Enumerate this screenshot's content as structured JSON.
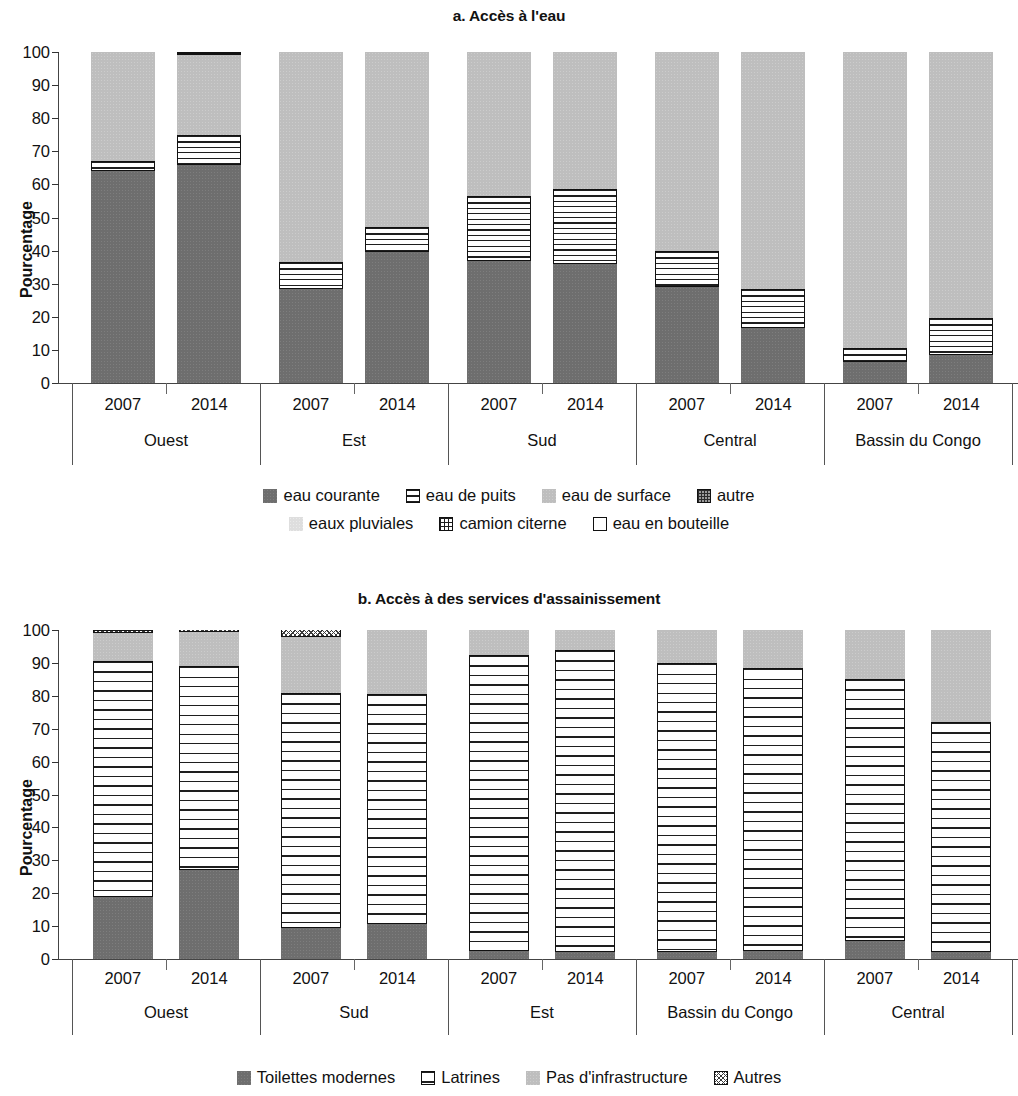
{
  "figure": {
    "panel_a": {
      "title": "a. Accès à l'eau",
      "ylabel": "Pourcentage",
      "yticks": [
        "100",
        "90",
        "80",
        "70",
        "60",
        "50",
        "40",
        "30",
        "20",
        "10",
        "0"
      ],
      "regions": [
        "Ouest",
        "Est",
        "Sud",
        "Central",
        "Bassin du Congo"
      ],
      "years": [
        "2007",
        "2014"
      ],
      "legend": [
        {
          "label": "eau courante",
          "key": "courante"
        },
        {
          "label": "eau de puits",
          "key": "puits"
        },
        {
          "label": "eau de surface",
          "key": "surface"
        },
        {
          "label": "autre",
          "key": "autre"
        },
        {
          "label": "eaux pluviales",
          "key": "pluviales"
        },
        {
          "label": "camion citerne",
          "key": "camion"
        },
        {
          "label": "eau en bouteille",
          "key": "bouteille"
        }
      ]
    },
    "panel_b": {
      "title": "b. Accès à des services d'assainissement",
      "ylabel": "Pourcentage",
      "yticks": [
        "100",
        "90",
        "80",
        "70",
        "60",
        "50",
        "40",
        "30",
        "20",
        "10",
        "0"
      ],
      "regions": [
        "Ouest",
        "Sud",
        "Est",
        "Bassin du Congo",
        "Central"
      ],
      "years": [
        "2007",
        "2014"
      ],
      "legend": [
        {
          "label": "Toilettes modernes",
          "key": "moderne"
        },
        {
          "label": "Latrines",
          "key": "latrines"
        },
        {
          "label": "Pas d'infrastructure",
          "key": "pasinfra"
        },
        {
          "label": "Autres",
          "key": "autres"
        }
      ]
    }
  },
  "chart_data": [
    {
      "type": "bar",
      "stacked": true,
      "title": "a. Accès à l'eau",
      "xlabel": "",
      "ylabel": "Pourcentage",
      "ylim": [
        0,
        100
      ],
      "yticks": [
        0,
        10,
        20,
        30,
        40,
        50,
        60,
        70,
        80,
        90,
        100
      ],
      "grid": false,
      "legend_position": "bottom",
      "groups": [
        "Ouest",
        "Est",
        "Sud",
        "Central",
        "Bassin du Congo"
      ],
      "subgroups": [
        "2007",
        "2014"
      ],
      "categories": [
        "Ouest 2007",
        "Ouest 2014",
        "Est 2007",
        "Est 2014",
        "Sud 2007",
        "Sud 2014",
        "Central 2007",
        "Central 2014",
        "Bassin du Congo 2007",
        "Bassin du Congo 2014"
      ],
      "series": [
        {
          "name": "eau courante",
          "values": [
            64,
            66,
            28.5,
            39.5,
            37,
            36,
            29,
            16.5,
            6.5,
            8.5
          ]
        },
        {
          "name": "eau de puits",
          "values": [
            3,
            9,
            8,
            7.5,
            19.5,
            22.5,
            11,
            12,
            4,
            11
          ]
        },
        {
          "name": "eau de surface",
          "values": [
            33,
            24,
            63.5,
            53,
            44.5,
            42.5,
            61,
            72,
            90.5,
            81.5
          ]
        },
        {
          "name": "autre",
          "values": [
            0,
            1.5,
            1,
            1,
            0,
            1,
            0,
            1,
            0,
            0
          ]
        }
      ]
    },
    {
      "type": "bar",
      "stacked": true,
      "title": "b. Accès à des services d'assainissement",
      "xlabel": "",
      "ylabel": "Pourcentage",
      "ylim": [
        0,
        100
      ],
      "yticks": [
        0,
        10,
        20,
        30,
        40,
        50,
        60,
        70,
        80,
        90,
        100
      ],
      "grid": false,
      "legend_position": "bottom",
      "groups": [
        "Ouest",
        "Sud",
        "Est",
        "Bassin du Congo",
        "Central"
      ],
      "subgroups": [
        "2007",
        "2014"
      ],
      "categories": [
        "Ouest 2007",
        "Ouest 2014",
        "Sud 2007",
        "Sud 2014",
        "Est 2007",
        "Est 2014",
        "Bassin du Congo 2007",
        "Bassin du Congo 2014",
        "Central 2007",
        "Central 2014"
      ],
      "series": [
        {
          "name": "Toilettes modernes",
          "values": [
            19,
            27,
            9.5,
            10.5,
            2.5,
            2,
            2,
            2.5,
            5.5,
            2
          ]
        },
        {
          "name": "Latrines",
          "values": [
            71.5,
            62,
            71.5,
            70,
            90,
            92,
            88,
            86,
            79.5,
            70
          ]
        },
        {
          "name": "Pas d'infrastructure",
          "values": [
            8.5,
            10.5,
            17,
            19.5,
            8.5,
            7,
            10.5,
            12.5,
            16.5,
            29.5
          ]
        },
        {
          "name": "Autres",
          "values": [
            1,
            1.5,
            3.5,
            0,
            0,
            0,
            0,
            0,
            0,
            0
          ]
        }
      ]
    }
  ]
}
